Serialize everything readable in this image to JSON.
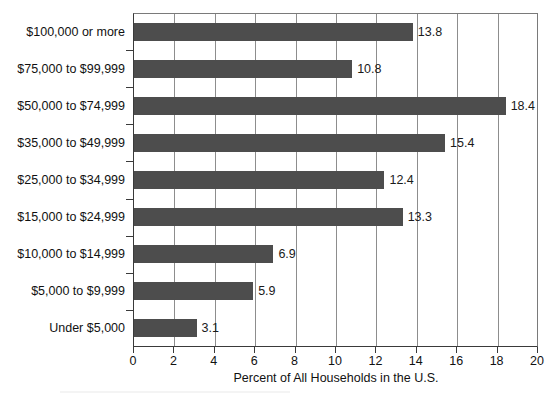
{
  "chart_data": {
    "type": "bar",
    "orientation": "horizontal",
    "title": "",
    "xlabel": "Percent of All Households in the U.S.",
    "ylabel": "",
    "xlim": [
      0,
      20
    ],
    "xticks": [
      "0",
      "2",
      "4",
      "6",
      "8",
      "10",
      "12",
      "14",
      "16",
      "18",
      "20"
    ],
    "grid": "vertical",
    "legend": "none",
    "bar_color": "#4d4d4d",
    "categories": [
      "$100,000 or more",
      "$75,000 to $99,999",
      "$50,000 to $74,999",
      "$35,000 to $49,999",
      "$25,000 to $34,999",
      "$15,000 to $24,999",
      "$10,000 to $14,999",
      "$5,000 to $9,999",
      "Under $5,000"
    ],
    "values": [
      13.8,
      10.8,
      18.4,
      15.4,
      12.4,
      13.3,
      6.9,
      5.9,
      3.1
    ],
    "value_labels": [
      "13.8",
      "10.8",
      "18.4",
      "15.4",
      "12.4",
      "13.3",
      "6.9",
      "5.9",
      "3.1"
    ]
  }
}
